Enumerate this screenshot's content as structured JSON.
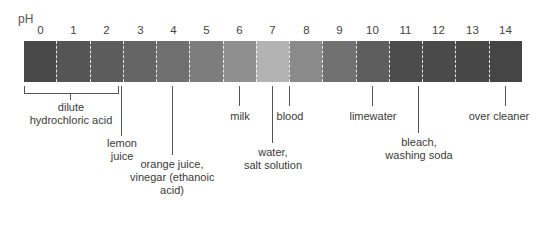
{
  "scale": {
    "unit_label": "pH",
    "ticks": [
      "0",
      "1",
      "2",
      "3",
      "4",
      "5",
      "6",
      "7",
      "8",
      "9",
      "10",
      "11",
      "12",
      "13",
      "14"
    ],
    "segment_colors": [
      "#484848",
      "#555555",
      "#5c5c5c",
      "#656565",
      "#6f6f6f",
      "#7d7d7d",
      "#8f8f8f",
      "#b3b3b3",
      "#8a8a8a",
      "#717171",
      "#5e5e5e",
      "#4c4c4c",
      "#4a4a4a",
      "#474747",
      "#454545"
    ]
  },
  "callouts": [
    {
      "name": "dilute-hydrochloric-acid",
      "lines": [
        "dilute",
        "hydrochloric acid"
      ],
      "ph": "0-2"
    },
    {
      "name": "lemon-juice",
      "lines": [
        "lemon",
        "juice"
      ],
      "ph": "2.5"
    },
    {
      "name": "orange-juice-vinegar",
      "lines": [
        "orange juice,",
        "vinegar (ethanoic",
        "acid)"
      ],
      "ph": "4"
    },
    {
      "name": "milk",
      "lines": [
        "milk"
      ],
      "ph": "6"
    },
    {
      "name": "water-salt-solution",
      "lines": [
        "water,",
        "salt solution"
      ],
      "ph": "7"
    },
    {
      "name": "blood",
      "lines": [
        "blood"
      ],
      "ph": "7.5"
    },
    {
      "name": "limewater",
      "lines": [
        "limewater"
      ],
      "ph": "10"
    },
    {
      "name": "bleach-washing-soda",
      "lines": [
        "bleach,",
        "washing soda"
      ],
      "ph": "11"
    },
    {
      "name": "oven-cleaner",
      "lines": [
        "over cleaner"
      ],
      "ph": "14"
    }
  ]
}
